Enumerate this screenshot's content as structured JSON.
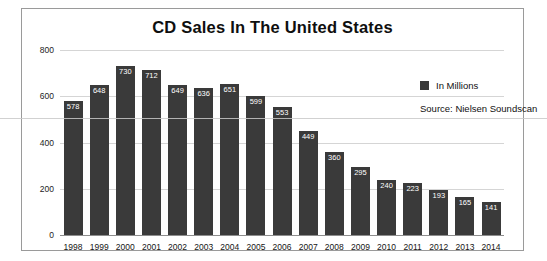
{
  "chart_data": {
    "type": "bar",
    "title": "CD Sales In The United States",
    "xlabel": "",
    "ylabel": "",
    "ylim": [
      0,
      800
    ],
    "yticks": [
      0,
      200,
      400,
      600,
      800
    ],
    "grid": true,
    "legend_position": "top-right",
    "legend": [
      "In Millions"
    ],
    "annotations": [
      "Source: Nielsen Soundscan"
    ],
    "bar_color": "#3a3a3a",
    "categories": [
      "1998",
      "1999",
      "2000",
      "2001",
      "2002",
      "2003",
      "2004",
      "2005",
      "2006",
      "2007",
      "2008",
      "2009",
      "2010",
      "2011",
      "2012",
      "2013",
      "2014"
    ],
    "values": [
      578,
      648,
      730,
      712,
      649,
      636,
      651,
      599,
      553,
      449,
      360,
      295,
      240,
      223,
      193,
      165,
      141
    ],
    "series": [
      {
        "name": "In Millions",
        "values": [
          578,
          648,
          730,
          712,
          649,
          636,
          651,
          599,
          553,
          449,
          360,
          295,
          240,
          223,
          193,
          165,
          141
        ]
      }
    ]
  },
  "legend": {
    "label": "In Millions",
    "swatch_color": "#3a3a3a"
  },
  "source": {
    "text": "Source: Nielsen Soundscan"
  }
}
